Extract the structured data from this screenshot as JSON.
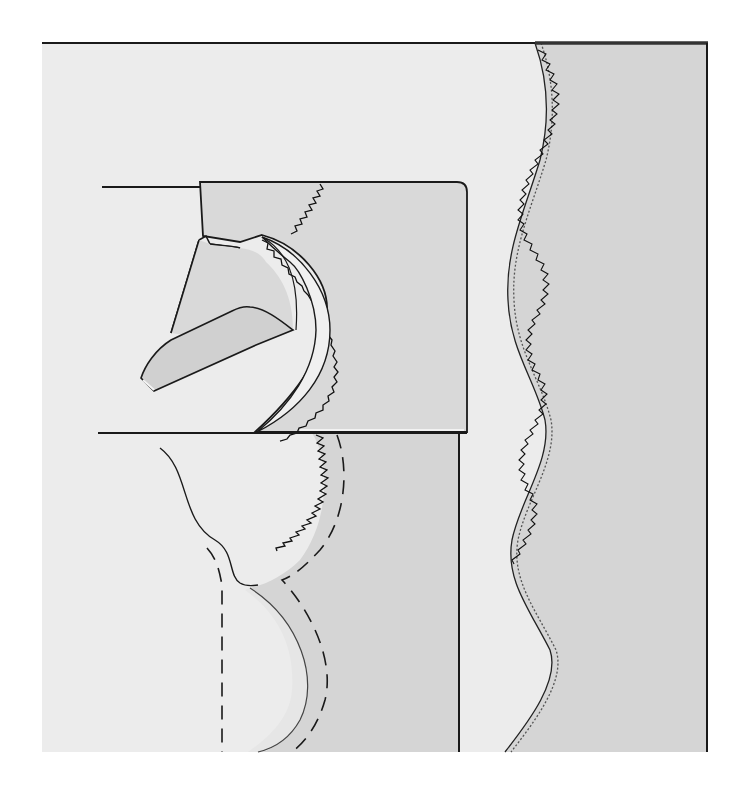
{
  "figure": {
    "caption": ""
  },
  "colors": {
    "page_background": "#ffffff",
    "panel_background": "#ececec",
    "fabric_shade": "#d5d5d5",
    "foot_fill": "#d9d9d9",
    "foot_highlight": "#f2f2f2",
    "line": "#1a1a1a",
    "stitch": "#111111"
  },
  "elements": {
    "panel": "background-panel",
    "right_fabric": "fabric-right-with-wavy-zigzag-edge",
    "presser_foot": "presser-foot",
    "foot_toe": "presser-foot-toe",
    "curved_guide": "curved-edge-guide",
    "lower_fabric": "fabric-lower-with-curved-seam",
    "seam_lines": "dashed-seam-lines"
  }
}
